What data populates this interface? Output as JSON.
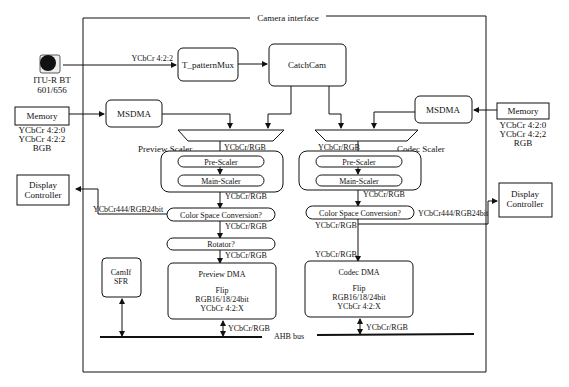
{
  "title": "Camera interface",
  "inputs": {
    "camera": {
      "label1": "ITU-R BT",
      "label2": "601/656",
      "signal": "YCbCr 4:2:2"
    },
    "memory_left": {
      "label": "Memory",
      "formats": [
        "YCbCr 4:2:0",
        "YCbCr 4:2:2",
        "BGB"
      ]
    },
    "memory_right": {
      "label": "Memory",
      "formats": [
        "YCbCr 4:2:0",
        "YCbCr 4:2;2",
        "RGB"
      ]
    }
  },
  "outputs": {
    "display_left": {
      "label1": "Display",
      "label2": "Controller",
      "signal": "YCbCr444/RGB24bit"
    },
    "display_right": {
      "label1": "Display",
      "label2": "Controller",
      "signal": "YCbCr444/RGB24bit"
    }
  },
  "blocks": {
    "pattern_mux": "T_patternMux",
    "catchcam": "CatchCam",
    "msdma_left": "MSDMA",
    "msdma_right": "MSDMA",
    "camif_sfr_1": "CamIf",
    "camif_sfr_2": "SFR",
    "ahb_bus": "AHB bus"
  },
  "preview": {
    "scaler_label": "Preview Scaler",
    "pre_scaler": "Pre-Scaler",
    "main_scaler": "Main-Scaler",
    "csc": "Color Space Conversion?",
    "rotator": "Rotator?",
    "dma_title": "Preview DMA",
    "dma_lines": [
      "Flip",
      "RGB16/18/24bit",
      "YCbCr 4:2:X"
    ],
    "signals": [
      "YCbCr/RGB",
      "YCbCr/RGB",
      "YCbCr/RGB",
      "YCbCr/RGB",
      "YCbCr/RGB"
    ]
  },
  "codec": {
    "scaler_label": "Codec Scaler",
    "pre_scaler": "Pre-Scaler",
    "main_scaler": "Main-Scaler",
    "csc": "Color Space Conversion?",
    "dma_title": "Codec DMA",
    "dma_lines": [
      "Flip",
      "RGB16/18/24bit",
      "YCbCr 4:2:X"
    ],
    "signals": [
      "YCbCr/RGB",
      "YCbCr/RGB",
      "YCbCr/RGB",
      "YCbCr/RGB",
      "YCbCr/RGB"
    ]
  }
}
